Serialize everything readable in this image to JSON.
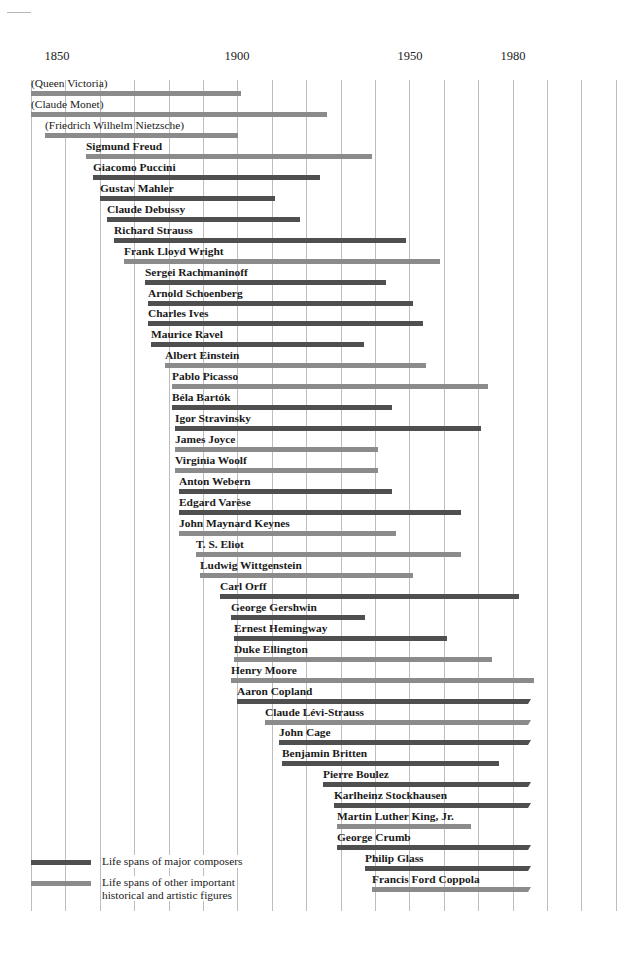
{
  "page": {
    "page_number": ""
  },
  "chart_data": {
    "type": "timeline",
    "title": "",
    "xlabel": "",
    "ylabel": "",
    "x_axis": {
      "tick_labels": [
        {
          "label": "1850",
          "year": 1850,
          "x": 57
        },
        {
          "label": "1900",
          "year": 1900,
          "x": 237
        },
        {
          "label": "1950",
          "year": 1950,
          "x": 410
        },
        {
          "label": "1980",
          "year": 1980,
          "x": 513
        }
      ],
      "gridlines_years": [
        1840,
        1850,
        1860,
        1870,
        1880,
        1890,
        1900,
        1910,
        1920,
        1930,
        1940,
        1950,
        1960,
        1970,
        1980,
        1990,
        2000,
        2010
      ],
      "range": [
        1840,
        2010
      ],
      "px_per_year": 3.44,
      "origin_x": 31,
      "grid": true
    },
    "legend": [
      {
        "type": "composer",
        "label": "Life spans of major composers",
        "color": "#4f4f4f"
      },
      {
        "type": "other",
        "label": "Life spans of other important\nhistorical and artistic figures",
        "color": "#8b8b8b"
      }
    ],
    "colors": {
      "composer": "#4f4f4f",
      "other": "#8b8b8b",
      "gridline": "#bdbdbd"
    },
    "series": [
      {
        "name": "(Queen Victoria)",
        "start": 1819,
        "end": 1901,
        "type": "other",
        "bold": false,
        "open": false
      },
      {
        "name": "(Claude Monet)",
        "start": 1840,
        "end": 1926,
        "type": "other",
        "bold": false,
        "open": false
      },
      {
        "name": "(Friedrich Wilhelm Nietzsche)",
        "start": 1844,
        "end": 1900,
        "type": "other",
        "bold": false,
        "open": false
      },
      {
        "name": "Sigmund Freud",
        "start": 1856,
        "end": 1939,
        "type": "other",
        "bold": true,
        "open": false
      },
      {
        "name": "Giacomo Puccini",
        "start": 1858,
        "end": 1924,
        "type": "composer",
        "bold": true,
        "open": false
      },
      {
        "name": "Gustav Mahler",
        "start": 1860,
        "end": 1911,
        "type": "composer",
        "bold": true,
        "open": false
      },
      {
        "name": "Claude Debussy",
        "start": 1862,
        "end": 1918,
        "type": "composer",
        "bold": true,
        "open": false
      },
      {
        "name": "Richard Strauss",
        "start": 1864,
        "end": 1949,
        "type": "composer",
        "bold": true,
        "open": false
      },
      {
        "name": "Frank Lloyd Wright",
        "start": 1867,
        "end": 1959,
        "type": "other",
        "bold": true,
        "open": false
      },
      {
        "name": "Sergei Rachmaninoff",
        "start": 1873,
        "end": 1943,
        "type": "composer",
        "bold": true,
        "open": false
      },
      {
        "name": "Arnold Schoenberg",
        "start": 1874,
        "end": 1951,
        "type": "composer",
        "bold": true,
        "open": false
      },
      {
        "name": "Charles Ives",
        "start": 1874,
        "end": 1954,
        "type": "composer",
        "bold": true,
        "open": false
      },
      {
        "name": "Maurice Ravel",
        "start": 1875,
        "end": 1937,
        "type": "composer",
        "bold": true,
        "open": false
      },
      {
        "name": "Albert Einstein",
        "start": 1879,
        "end": 1955,
        "type": "other",
        "bold": true,
        "open": false
      },
      {
        "name": "Pablo Picasso",
        "start": 1881,
        "end": 1973,
        "type": "other",
        "bold": true,
        "open": false
      },
      {
        "name": "Béla Bartók",
        "start": 1881,
        "end": 1945,
        "type": "composer",
        "bold": true,
        "open": false
      },
      {
        "name": "Igor Stravinsky",
        "start": 1882,
        "end": 1971,
        "type": "composer",
        "bold": true,
        "open": false
      },
      {
        "name": "James Joyce",
        "start": 1882,
        "end": 1941,
        "type": "other",
        "bold": true,
        "open": false
      },
      {
        "name": "Virginia Woolf",
        "start": 1882,
        "end": 1941,
        "type": "other",
        "bold": true,
        "open": false
      },
      {
        "name": "Anton Webern",
        "start": 1883,
        "end": 1945,
        "type": "composer",
        "bold": true,
        "open": false
      },
      {
        "name": "Edgard Varèse",
        "start": 1883,
        "end": 1965,
        "type": "composer",
        "bold": true,
        "open": false
      },
      {
        "name": "John Maynard Keynes",
        "start": 1883,
        "end": 1946,
        "type": "other",
        "bold": true,
        "open": false
      },
      {
        "name": "T. S. Eliot",
        "start": 1888,
        "end": 1965,
        "type": "other",
        "bold": true,
        "open": false
      },
      {
        "name": "Ludwig Wittgenstein",
        "start": 1889,
        "end": 1951,
        "type": "other",
        "bold": true,
        "open": false
      },
      {
        "name": "Carl Orff",
        "start": 1895,
        "end": 1982,
        "type": "composer",
        "bold": true,
        "open": false
      },
      {
        "name": "George Gershwin",
        "start": 1898,
        "end": 1937,
        "type": "composer",
        "bold": true,
        "open": false
      },
      {
        "name": "Ernest Hemingway",
        "start": 1899,
        "end": 1961,
        "type": "composer",
        "bold": true,
        "open": false
      },
      {
        "name": "Duke Ellington",
        "start": 1899,
        "end": 1974,
        "type": "other",
        "bold": true,
        "open": false
      },
      {
        "name": "Henry Moore",
        "start": 1898,
        "end": 1986,
        "type": "other",
        "bold": true,
        "open": false
      },
      {
        "name": "Aaron Copland",
        "start": 1900,
        "end": 1985,
        "type": "composer",
        "bold": true,
        "open": true
      },
      {
        "name": "Claude Lévi-Strauss",
        "start": 1908,
        "end": 1985,
        "type": "other",
        "bold": true,
        "open": true
      },
      {
        "name": "John Cage",
        "start": 1912,
        "end": 1985,
        "type": "composer",
        "bold": true,
        "open": true
      },
      {
        "name": "Benjamin Britten",
        "start": 1913,
        "end": 1976,
        "type": "composer",
        "bold": true,
        "open": false
      },
      {
        "name": "Pierre Boulez",
        "start": 1925,
        "end": 1985,
        "type": "composer",
        "bold": true,
        "open": true
      },
      {
        "name": "Karlheinz Stockhausen",
        "start": 1928,
        "end": 1985,
        "type": "composer",
        "bold": true,
        "open": true
      },
      {
        "name": "Martin Luther King, Jr.",
        "start": 1929,
        "end": 1968,
        "type": "other",
        "bold": true,
        "open": false
      },
      {
        "name": "George Crumb",
        "start": 1929,
        "end": 1985,
        "type": "composer",
        "bold": true,
        "open": true
      },
      {
        "name": "Philip Glass",
        "start": 1937,
        "end": 1985,
        "type": "composer",
        "bold": true,
        "open": true
      },
      {
        "name": "Francis Ford Coppola",
        "start": 1939,
        "end": 1985,
        "type": "other",
        "bold": true,
        "open": true
      }
    ]
  }
}
